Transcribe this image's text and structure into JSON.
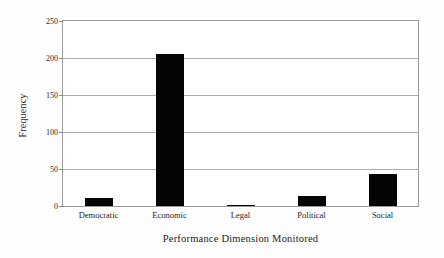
{
  "chart_data": {
    "type": "bar",
    "title": "",
    "xlabel": "Performance Dimension Monitored",
    "ylabel": "Frequency",
    "categories": [
      "Democratic",
      "Economic",
      "Legal",
      "Political",
      "Social"
    ],
    "values": [
      11,
      206,
      1,
      14,
      43
    ],
    "ylim": [
      0,
      250
    ],
    "yticks": [
      0,
      50,
      100,
      150,
      200,
      250
    ],
    "ytick_labels": [
      "0",
      "50",
      "100",
      "150",
      "200",
      "250"
    ],
    "grid": "horizontal",
    "legend": "none",
    "bar_color": "#050505",
    "frame_color": "#9a9a9a",
    "gridline_color": "#adadad"
  }
}
